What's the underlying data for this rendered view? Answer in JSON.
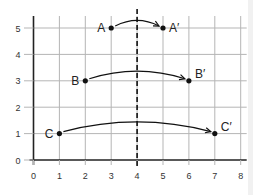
{
  "chart_data": {
    "type": "scatter",
    "title": "",
    "xlabel": "",
    "ylabel": "",
    "xlim": [
      0,
      8
    ],
    "ylim": [
      0,
      5
    ],
    "grid": true,
    "x_ticks": [
      "0",
      "1",
      "2",
      "3",
      "4",
      "5",
      "6",
      "7",
      "8"
    ],
    "y_ticks": [
      "0",
      "1",
      "2",
      "3",
      "4",
      "5"
    ],
    "line_of_reflection": {
      "x": 4,
      "style": "dashed"
    },
    "points": [
      {
        "label": "A",
        "x": 3,
        "y": 5
      },
      {
        "label": "A′",
        "x": 5,
        "y": 5
      },
      {
        "label": "B",
        "x": 2,
        "y": 3
      },
      {
        "label": "B′",
        "x": 6,
        "y": 3
      },
      {
        "label": "C",
        "x": 1,
        "y": 1
      },
      {
        "label": "C′",
        "x": 7,
        "y": 1
      }
    ],
    "arrows": [
      {
        "from": "A",
        "to": "A′"
      },
      {
        "from": "B",
        "to": "B′"
      },
      {
        "from": "C",
        "to": "C′"
      }
    ]
  },
  "colors": {
    "axis": "#222222",
    "grid": "#b5b5b5",
    "ink": "#111111"
  }
}
